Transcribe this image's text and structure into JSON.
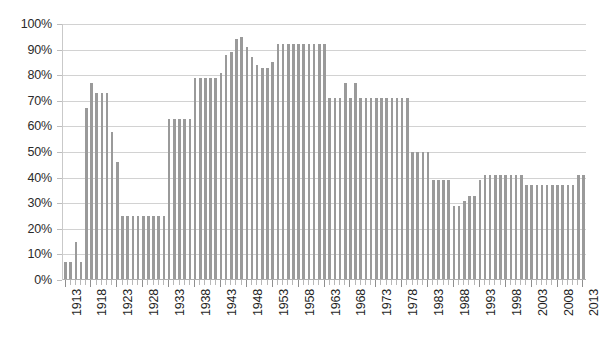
{
  "chart": {
    "title": "",
    "type": "bar"
  },
  "chart_data": {
    "type": "bar",
    "title": "",
    "subtitle": "",
    "xlabel": "",
    "ylabel": "",
    "ylim": [
      0,
      100
    ],
    "y_unit": "%",
    "grid": true,
    "legend": "none",
    "y_ticks": [
      "0%",
      "10%",
      "20%",
      "30%",
      "40%",
      "50%",
      "60%",
      "70%",
      "80%",
      "90%",
      "100%"
    ],
    "y_tick_values": [
      0,
      10,
      20,
      30,
      40,
      50,
      60,
      70,
      80,
      90,
      100
    ],
    "x_tick_labels": [
      "1913",
      "1918",
      "1923",
      "1928",
      "1933",
      "1938",
      "1943",
      "1948",
      "1953",
      "1958",
      "1963",
      "1968",
      "1973",
      "1978",
      "1983",
      "1988",
      "1993",
      "1998",
      "2003",
      "2008",
      "2013"
    ],
    "x_tick_step": 5,
    "bar_color": "#9a9a9a",
    "gridline_color": "#d2d2d2",
    "axis_color": "#b0b0b0",
    "categories": [
      "1913",
      "1914",
      "1915",
      "1916",
      "1917",
      "1918",
      "1919",
      "1920",
      "1921",
      "1922",
      "1923",
      "1924",
      "1925",
      "1926",
      "1927",
      "1928",
      "1929",
      "1930",
      "1931",
      "1932",
      "1933",
      "1934",
      "1935",
      "1936",
      "1937",
      "1938",
      "1939",
      "1940",
      "1941",
      "1942",
      "1943",
      "1944",
      "1945",
      "1946",
      "1947",
      "1948",
      "1949",
      "1950",
      "1951",
      "1952",
      "1953",
      "1954",
      "1955",
      "1956",
      "1957",
      "1958",
      "1959",
      "1960",
      "1961",
      "1962",
      "1963",
      "1964",
      "1965",
      "1966",
      "1967",
      "1968",
      "1969",
      "1970",
      "1971",
      "1972",
      "1973",
      "1974",
      "1975",
      "1976",
      "1977",
      "1978",
      "1979",
      "1980",
      "1981",
      "1982",
      "1983",
      "1984",
      "1985",
      "1986",
      "1987",
      "1988",
      "1989",
      "1990",
      "1991",
      "1992",
      "1993",
      "1994",
      "1995",
      "1996",
      "1997",
      "1998",
      "1999",
      "2000",
      "2001",
      "2002",
      "2003",
      "2004",
      "2005",
      "2006",
      "2007",
      "2008",
      "2009",
      "2010",
      "2011",
      "2012",
      "2013"
    ],
    "values": [
      7,
      7,
      15,
      7,
      67,
      77,
      73,
      73,
      73,
      58,
      46,
      25,
      25,
      25,
      25,
      25,
      25,
      25,
      25,
      25,
      63,
      63,
      63,
      63,
      63,
      79,
      79,
      79,
      79,
      79,
      81,
      88,
      89,
      94,
      95,
      91,
      87,
      84,
      83,
      83,
      85,
      92,
      92,
      92,
      92,
      92,
      92,
      92,
      92,
      92,
      92,
      71,
      71,
      71,
      77,
      71,
      77,
      71,
      71,
      71,
      71,
      71,
      71,
      71,
      71,
      71,
      71,
      50,
      50,
      50,
      50,
      39,
      39,
      39,
      39,
      29,
      29,
      31,
      33,
      33,
      39,
      41,
      41,
      41,
      41,
      41,
      41,
      41,
      41,
      37,
      37,
      37,
      37,
      37,
      37,
      37,
      37,
      37,
      37,
      41,
      41
    ]
  }
}
